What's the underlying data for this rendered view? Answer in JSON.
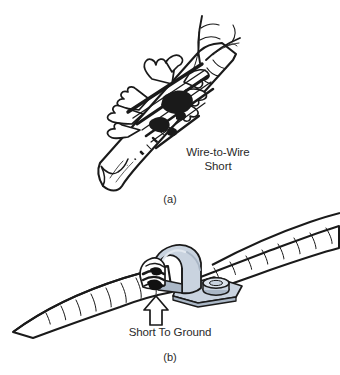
{
  "figure": {
    "type": "technical-line-drawing",
    "background_color": "#ffffff",
    "ink_color": "#1a1a1a",
    "panels": [
      {
        "id": "a",
        "caption": "(a)",
        "label": "Wire-to-Wire\nShort",
        "label_line_1": "Wire-to-Wire",
        "label_line_2": "Short",
        "subject": "convoluted wire harness tube with torn/split insulation exposing bare conductor strands touching each other",
        "elements": [
          "harness-tube",
          "cut-tube-end",
          "spiral-ribbing",
          "torn-insulation-flaps",
          "exposed-bare-conductors",
          "frayed-wire-ends"
        ]
      },
      {
        "id": "b",
        "caption": "(b)",
        "label": "Short To Ground",
        "subject": "wire harness pinched under a metal mounting clamp bolted to a grounded bracket",
        "clamp_color": "#c9d3df",
        "clamp_shadow_color": "#aab7c6",
        "elements": [
          "harness-tube",
          "spiral-ribbing",
          "metal-clamp",
          "mounting-plate",
          "bolt-head",
          "pinched-conductors",
          "callout-arrow"
        ]
      }
    ]
  },
  "labels": {
    "wire_to_wire_line1": "Wire-to-Wire",
    "wire_to_wire_line2": "Short",
    "short_to_ground": "Short To Ground",
    "caption_a": "(a)",
    "caption_b": "(b)"
  },
  "colors": {
    "background": "#ffffff",
    "ink": "#1a1a1a",
    "text": "#2a2a2a",
    "clamp_fill": "#c9d3df",
    "clamp_fill_dark": "#aab7c6",
    "clamp_fill_light": "#e2e8ef",
    "conductor_dark": "#111111"
  }
}
